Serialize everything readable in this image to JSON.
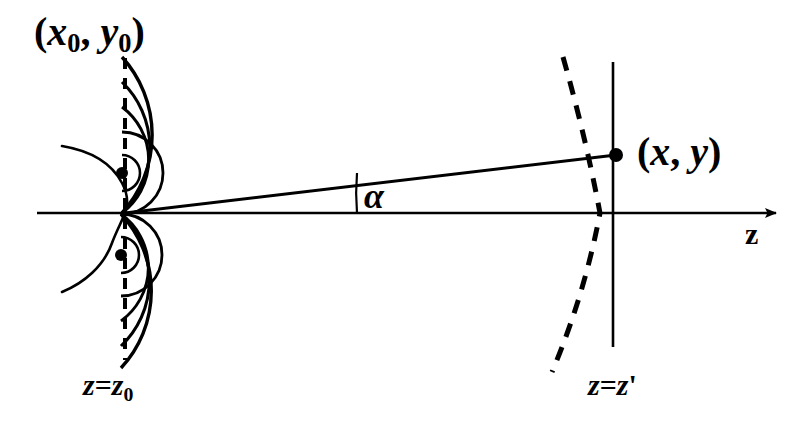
{
  "figure": {
    "background_color": "#ffffff",
    "ink_color": "#000000",
    "width": 807,
    "height": 434
  },
  "labels": {
    "source_point": "(x₀, y₀)",
    "source_point_parts": {
      "open": "(",
      "x": "x",
      "xsub": "0",
      "comma": ", ",
      "y": "y",
      "ysub": "0",
      "close": ")"
    },
    "observation_point": "(x, y)",
    "observation_point_parts": {
      "open": "(",
      "x": "x",
      "comma": ", ",
      "y": "y",
      "close": ")"
    },
    "angle": "α",
    "source_plane": "z = z₀",
    "source_plane_parts": {
      "z": "z",
      "eq": "=",
      "z2": "z",
      "sub": "0"
    },
    "observation_plane": "z = z'",
    "observation_plane_parts": {
      "z": "z",
      "eq": "=",
      "z2": "z",
      "prime": "'"
    },
    "axis": "z"
  },
  "geometry": {
    "optical_axis": {
      "x1": 37,
      "y1": 213,
      "x2": 780,
      "y2": 213,
      "arrow": true
    },
    "source_plane_line": {
      "x": 125,
      "y1": 58,
      "y2": 360,
      "style": "dashed"
    },
    "observation_plane_line": {
      "x": 613,
      "y1": 62,
      "y2": 347,
      "style": "solid"
    },
    "ray": {
      "x1": 125,
      "y1": 213,
      "x2": 616,
      "y2": 155
    },
    "angle_arc": {
      "cx": 125,
      "cy": 213,
      "r": 232,
      "label_x": 375,
      "label_y": 197
    },
    "sources": [
      {
        "cx": 122,
        "cy": 173,
        "r": 6
      },
      {
        "cx": 121,
        "cy": 255,
        "r": 6
      }
    ],
    "observation_dot": {
      "cx": 616,
      "cy": 155,
      "r": 7
    },
    "wavelet_radii_upper": [
      18,
      41,
      66,
      91,
      116
    ],
    "wavelet_radii_lower": [
      18,
      41,
      66,
      91,
      113
    ],
    "aperture_curve": "S-shaped aperture profile through both source points",
    "spherical_wavefront": {
      "style": "dashed",
      "cx": 125,
      "cy": 213,
      "r": 494
    }
  }
}
